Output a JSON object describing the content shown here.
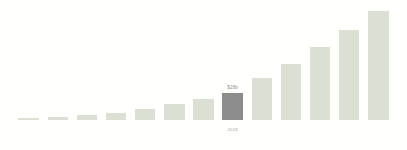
{
  "chart_data": {
    "type": "bar",
    "title": "",
    "subtitle": "",
    "xlabel": "",
    "ylabel": "",
    "grid": false,
    "legend": null,
    "ylim": [
      0,
      120
    ],
    "categories": [
      "",
      "",
      "",
      "",
      "",
      "",
      "",
      "2018",
      "",
      "",
      "",
      "",
      ""
    ],
    "values": [
      2,
      3,
      5,
      7,
      11,
      17,
      22,
      28,
      44,
      59,
      76,
      94,
      114
    ],
    "annotations": [
      {
        "index": 7,
        "value_label": "$28b",
        "tick_label": "2018",
        "highlight": true
      }
    ],
    "bar_color": "#dcdfd3",
    "highlight_color": "#8c8c8c",
    "background_color": "#fffffe",
    "value_label_color": "#8f8f8a",
    "tick_label_color": "#a5a5a0"
  }
}
